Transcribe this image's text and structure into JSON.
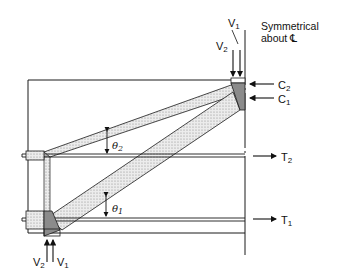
{
  "diagram": {
    "type": "strut-and-tie model",
    "note": {
      "line1": "Symmetrical",
      "line2": "about ℄"
    },
    "loads_top": {
      "v1": "V",
      "v1_sub": "1",
      "v2": "V",
      "v2_sub": "2"
    },
    "loads_bottom": {
      "v2": "V",
      "v2_sub": "2",
      "v1": "V",
      "v1_sub": "1"
    },
    "compression": [
      {
        "label": "C",
        "sub": "2"
      },
      {
        "label": "C",
        "sub": "1"
      }
    ],
    "ties": [
      {
        "label": "T",
        "sub": "2"
      },
      {
        "label": "T",
        "sub": "1"
      }
    ],
    "angles": [
      {
        "label": "θ",
        "sub": "2"
      },
      {
        "label": "θ",
        "sub": "1"
      }
    ],
    "colors": {
      "line": "#1a1a1a",
      "strut_fill": "#d8d8d8",
      "node_fill": "#8a8a8a"
    }
  }
}
